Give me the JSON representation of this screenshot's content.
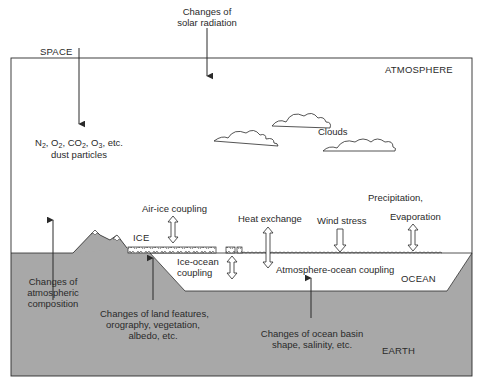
{
  "diagram": {
    "colors": {
      "earth_fill": "#a8a8a8",
      "line": "#2a2a2a",
      "background": "#ffffff"
    },
    "regions": {
      "space": "SPACE",
      "atmosphere": "ATMOSPHERE",
      "ocean": "OCEAN",
      "earth": "EARTH",
      "ice": "ICE",
      "clouds": "Clouds"
    },
    "labels": {
      "solar_radiation_line1": "Changes of",
      "solar_radiation_line2": "solar radiation",
      "composition_gases_n": "N",
      "composition_gases_o": ", O",
      "composition_gases_co": ", CO",
      "composition_gases_o3": ", O",
      "composition_gases_etc": ", etc.",
      "sub_2": "2",
      "sub_3": "3",
      "dust_particles": "dust particles",
      "air_ice_coupling": "Air-ice coupling",
      "heat_exchange": "Heat exchange",
      "wind_stress": "Wind stress",
      "precipitation": "Precipitation,",
      "evaporation": "Evaporation",
      "ice_ocean_coupling_line1": "Ice-ocean",
      "ice_ocean_coupling_line2": "coupling",
      "atmosphere_ocean_coupling": "Atmosphere-ocean coupling",
      "atmos_composition_line1": "Changes of",
      "atmos_composition_line2": "atmospheric",
      "atmos_composition_line3": "composition",
      "land_features_line1": "Changes of land features,",
      "land_features_line2": "orography, vegetation,",
      "land_features_line3": "albedo, etc.",
      "ocean_basin_line1": "Changes of ocean basin",
      "ocean_basin_line2": "shape, salinity, etc."
    }
  }
}
